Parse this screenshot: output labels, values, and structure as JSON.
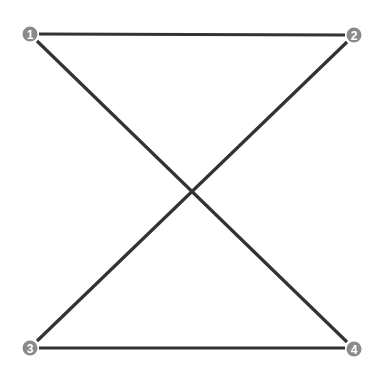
{
  "diagram": {
    "type": "numbered-points-crossed-quadrilateral",
    "line_color": "#333333",
    "node_color": "#8a8a8a",
    "node_text_color": "#ffffff",
    "nodes": [
      {
        "id": "1",
        "label": "1",
        "x": 30,
        "y": 34
      },
      {
        "id": "2",
        "label": "2",
        "x": 354,
        "y": 35
      },
      {
        "id": "3",
        "label": "3",
        "x": 30,
        "y": 348
      },
      {
        "id": "4",
        "label": "4",
        "x": 354,
        "y": 349
      }
    ],
    "edges": [
      {
        "from": "1",
        "to": "2",
        "x1": 39,
        "y1": 34,
        "x2": 345,
        "y2": 35
      },
      {
        "from": "1",
        "to": "4",
        "x1": 37,
        "y1": 41,
        "x2": 347,
        "y2": 342
      },
      {
        "from": "2",
        "to": "3",
        "x1": 347,
        "y1": 42,
        "x2": 37,
        "y2": 341
      },
      {
        "from": "3",
        "to": "4",
        "x1": 39,
        "y1": 348,
        "x2": 345,
        "y2": 348
      }
    ]
  }
}
